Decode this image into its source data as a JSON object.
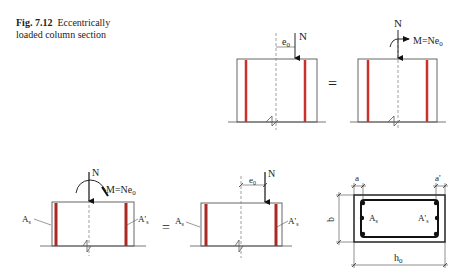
{
  "caption": {
    "fig_label": "Fig. 7.12",
    "line1": "Eccentrically",
    "line2": "loaded column section"
  },
  "labels": {
    "N": "N",
    "e0": "e",
    "e0_sub": "0",
    "moment": "M=Ne",
    "moment_sub": "0",
    "equals": "=",
    "As": "A",
    "As_sub": "s",
    "As_prime": "A'",
    "As_prime_sub": "s",
    "a": "a",
    "a_prime": "a'",
    "b": "b",
    "h0": "h",
    "h0_sub": "0"
  },
  "colors": {
    "rebar": "#c8322a",
    "line": "#555555",
    "dash": "#888888"
  },
  "panels": [
    {
      "id": "top-eccentric",
      "description": "column with eccentric load N at distance e0"
    },
    {
      "id": "top-equivalent",
      "description": "column with axial N and moment M=Ne0"
    },
    {
      "id": "bottom-moment",
      "description": "column with reinforcement As, A's under N and M=Ne0"
    },
    {
      "id": "bottom-eccentric",
      "description": "column with reinforcement As, A's under eccentric N"
    },
    {
      "id": "cross-section",
      "description": "rectangular section b x h0 with covers a, a'"
    }
  ]
}
